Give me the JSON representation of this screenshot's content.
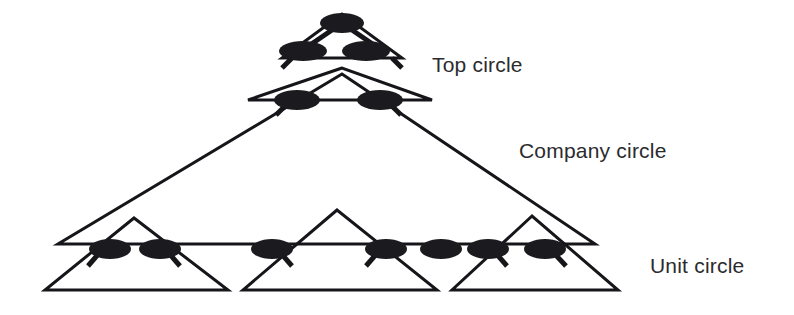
{
  "diagram": {
    "kind": "sociocracy-circle-hierarchy",
    "background_color": "#ffffff",
    "line_color": "#16161a",
    "node_color": "#1b1b1f",
    "text_color": "#2b2b2e",
    "labels": [
      {
        "id": "top-circle",
        "text": "Top circle",
        "x": 432,
        "y": 66
      },
      {
        "id": "company-circle",
        "text": "Company circle",
        "x": 519,
        "y": 152
      },
      {
        "id": "unit-circle",
        "text": "Unit circle",
        "x": 650,
        "y": 267
      }
    ],
    "triangles": [
      {
        "id": "top-circle-triangle",
        "points": "342,14 282,58 402,58",
        "stroke_width": 3
      },
      {
        "id": "second-level-triangle",
        "points": "342,68 248,100 432,100",
        "stroke_width": 3
      },
      {
        "id": "company-circle-triangle",
        "points": "342,74 58,244 595,244",
        "stroke_width": 3
      },
      {
        "id": "unit-triangle-left",
        "points": "134,218 45,290 228,290",
        "stroke_width": 3
      },
      {
        "id": "unit-triangle-center",
        "points": "337,210 243,290 437,290",
        "stroke_width": 3
      },
      {
        "id": "unit-triangle-right",
        "points": "532,216 452,290 618,290",
        "stroke_width": 3
      }
    ],
    "connector_edges": [
      {
        "id": "apex-to-left-second",
        "x1": 332,
        "y1": 30,
        "x2": 310,
        "y2": 45,
        "stroke_width": 5
      },
      {
        "id": "apex-to-right-second",
        "x1": 352,
        "y1": 30,
        "x2": 374,
        "y2": 45,
        "stroke_width": 5
      },
      {
        "id": "left-second-to-company",
        "x1": 292,
        "y1": 58,
        "x2": 282,
        "y2": 68,
        "stroke_width": 5
      },
      {
        "id": "right-second-to-company",
        "x1": 392,
        "y1": 58,
        "x2": 402,
        "y2": 68,
        "stroke_width": 5
      },
      {
        "id": "company-left-stub",
        "x1": 288,
        "y1": 103,
        "x2": 276,
        "y2": 115,
        "stroke_width": 5
      },
      {
        "id": "company-right-stub",
        "x1": 389,
        "y1": 103,
        "x2": 401,
        "y2": 115,
        "stroke_width": 5
      },
      {
        "id": "unit-stub-1",
        "x1": 101,
        "y1": 251,
        "x2": 88,
        "y2": 266,
        "stroke_width": 5
      },
      {
        "id": "unit-stub-2",
        "x1": 167,
        "y1": 251,
        "x2": 180,
        "y2": 266,
        "stroke_width": 5
      },
      {
        "id": "unit-stub-3",
        "x1": 279,
        "y1": 251,
        "x2": 292,
        "y2": 266,
        "stroke_width": 5
      },
      {
        "id": "unit-stub-4",
        "x1": 379,
        "y1": 251,
        "x2": 366,
        "y2": 266,
        "stroke_width": 5
      },
      {
        "id": "unit-stub-5",
        "x1": 494,
        "y1": 251,
        "x2": 507,
        "y2": 266,
        "stroke_width": 5
      },
      {
        "id": "unit-stub-6",
        "x1": 552,
        "y1": 251,
        "x2": 566,
        "y2": 266,
        "stroke_width": 5
      }
    ],
    "nodes": [
      {
        "id": "node-top-apex",
        "level": "top",
        "cx": 342,
        "cy": 23,
        "rx": 22,
        "ry": 10
      },
      {
        "id": "node-top-left",
        "level": "top",
        "cx": 303,
        "cy": 51,
        "rx": 24,
        "ry": 10
      },
      {
        "id": "node-top-right",
        "level": "top",
        "cx": 366,
        "cy": 51,
        "rx": 24,
        "ry": 10
      },
      {
        "id": "node-company-left",
        "level": "company",
        "cx": 297,
        "cy": 100,
        "rx": 23,
        "ry": 10
      },
      {
        "id": "node-company-right",
        "level": "company",
        "cx": 380,
        "cy": 100,
        "rx": 23,
        "ry": 10
      },
      {
        "id": "node-unit-1",
        "level": "unit",
        "cx": 110,
        "cy": 249,
        "rx": 21,
        "ry": 10
      },
      {
        "id": "node-unit-2",
        "level": "unit",
        "cx": 160,
        "cy": 249,
        "rx": 21,
        "ry": 10
      },
      {
        "id": "node-unit-3",
        "level": "unit",
        "cx": 272,
        "cy": 249,
        "rx": 21,
        "ry": 10
      },
      {
        "id": "node-unit-4",
        "level": "unit",
        "cx": 386,
        "cy": 249,
        "rx": 21,
        "ry": 10
      },
      {
        "id": "node-unit-5",
        "level": "unit",
        "cx": 441,
        "cy": 249,
        "rx": 21,
        "ry": 10
      },
      {
        "id": "node-unit-6",
        "level": "unit",
        "cx": 488,
        "cy": 249,
        "rx": 21,
        "ry": 10
      },
      {
        "id": "node-unit-7",
        "level": "unit",
        "cx": 545,
        "cy": 249,
        "rx": 21,
        "ry": 10
      }
    ]
  }
}
